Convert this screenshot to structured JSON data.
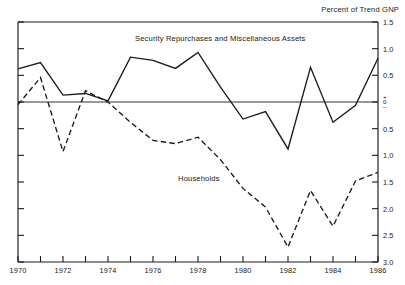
{
  "chart_data": {
    "type": "line",
    "title": "",
    "unit_label": "Percent of Trend GNP",
    "xlabel": "",
    "ylabel": "",
    "x": [
      1970,
      1971,
      1972,
      1973,
      1974,
      1975,
      1976,
      1977,
      1978,
      1979,
      1980,
      1981,
      1982,
      1983,
      1984,
      1985,
      1986
    ],
    "xlim": [
      1970,
      1986
    ],
    "ylim": [
      -3.0,
      1.5
    ],
    "y_inverted_labels": true,
    "grid": false,
    "legend_position": "inline-annotations",
    "xtick_labels": [
      "1970",
      "1972",
      "1974",
      "1976",
      "1978",
      "1980",
      "1982",
      "1984",
      "1986"
    ],
    "xtick_values": [
      1970,
      1972,
      1974,
      1976,
      1978,
      1980,
      1982,
      1984,
      1986
    ],
    "xtick_minor_values": [
      1971,
      1973,
      1975,
      1977,
      1979,
      1981,
      1983,
      1985
    ],
    "ytick_values": [
      1.5,
      1.0,
      0.5,
      0.0,
      -0.5,
      -1.0,
      -1.5,
      -2.0,
      -2.5,
      -3.0
    ],
    "ytick_labels": [
      "1.5",
      "1.0",
      "0.5",
      "0",
      "0.5",
      "1.0",
      "1.5",
      "2.0",
      "2.5",
      "3.0"
    ],
    "zero_label_plus": "+",
    "zero_label_zero": "0",
    "zero_label_minus": "–",
    "series": [
      {
        "name": "Security Repurchases and Miscellaneous Assets",
        "style": "solid",
        "color": "#1a1a1a",
        "values": [
          0.62,
          0.74,
          0.13,
          0.16,
          0.02,
          0.84,
          0.78,
          0.63,
          0.93,
          0.28,
          -0.32,
          -0.18,
          -0.88,
          0.65,
          -0.38,
          -0.06,
          0.82
        ]
      },
      {
        "name": "Households",
        "style": "dashed",
        "color": "#1a1a1a",
        "values": [
          -0.05,
          0.46,
          -0.93,
          0.21,
          0.0,
          -0.38,
          -0.72,
          -0.78,
          -0.66,
          -1.08,
          -1.62,
          -1.97,
          -2.72,
          -1.66,
          -2.33,
          -1.48,
          -1.32
        ]
      }
    ]
  },
  "plot": {
    "left_px": 18,
    "right_px": 378,
    "top_px": 22,
    "bottom_px": 262
  }
}
